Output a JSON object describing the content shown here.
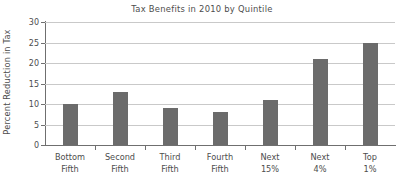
{
  "chart_data": {
    "type": "bar",
    "title": "Tax Benefits in 2010 by Quintile",
    "xlabel": "",
    "ylabel": "Percent Reduction in Tax",
    "categories": [
      "Bottom Fifth",
      "Second Fifth",
      "Third Fifth",
      "Fourth Fifth",
      "Next 15%",
      "Next 4%",
      "Top 1%"
    ],
    "category_lines": [
      [
        "Bottom",
        "Fifth"
      ],
      [
        "Second",
        "Fifth"
      ],
      [
        "Third",
        "Fifth"
      ],
      [
        "Fourth",
        "Fifth"
      ],
      [
        "Next",
        "15%"
      ],
      [
        "Next",
        "4%"
      ],
      [
        "Top",
        "1%"
      ]
    ],
    "values": [
      10,
      13,
      9,
      8,
      11,
      21,
      25
    ],
    "ylim": [
      0,
      30
    ],
    "ytick_labels": [
      "0",
      "5",
      "10",
      "15",
      "20",
      "25",
      "30"
    ],
    "ytick_values": [
      0,
      5,
      10,
      15,
      20,
      25,
      30
    ],
    "grid": true,
    "legend": false,
    "bar_color": "#6b6b6b",
    "gridline_color": "#c9c9c9",
    "axis_color": "#6f6f6f",
    "text_color": "#4d4d4d",
    "background": "#ffffff"
  }
}
